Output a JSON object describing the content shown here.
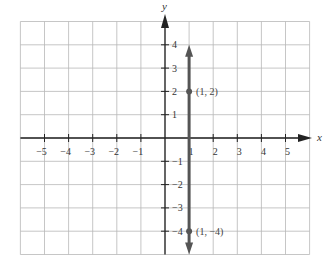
{
  "chart_data": {
    "type": "line",
    "title": "",
    "xlabel": "x",
    "ylabel": "y",
    "xlim": [
      -6,
      6
    ],
    "ylim": [
      -5,
      5
    ],
    "grid": true,
    "x_ticks": [
      -5,
      -4,
      -3,
      -2,
      -1,
      1,
      2,
      3,
      4,
      5
    ],
    "y_ticks": [
      -4,
      -3,
      -2,
      -1,
      1,
      2,
      3,
      4
    ],
    "x_tick_labels": [
      "−5",
      "−4",
      "−3",
      "−2",
      "−1",
      "1",
      "2",
      "3",
      "4",
      "5"
    ],
    "y_tick_labels": [
      "−4",
      "−3",
      "−2",
      "−1",
      "1",
      "2",
      "3",
      "4"
    ],
    "series": [
      {
        "name": "x = 1",
        "kind": "vertical-line-with-arrows",
        "x": 1,
        "y_range": [
          -5,
          4
        ],
        "color": "#555555"
      }
    ],
    "points": [
      {
        "x": 1,
        "y": 2,
        "label": "(1, 2)"
      },
      {
        "x": 1,
        "y": -4,
        "label": "(1, −4)"
      }
    ]
  }
}
